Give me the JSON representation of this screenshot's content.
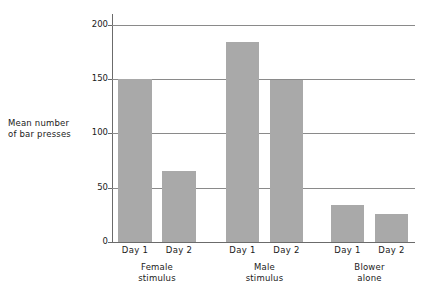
{
  "chart_data": {
    "type": "bar",
    "title": "",
    "xlabel": "",
    "ylabel": "Mean number\nof bar presses",
    "ylim": [
      0,
      210
    ],
    "yticks": [
      0,
      50,
      100,
      150,
      200
    ],
    "ytick_labels": [
      "0",
      "50",
      "100",
      "150",
      "200"
    ],
    "grid": true,
    "legend": "none",
    "groups": [
      {
        "name": "Female\nstimulus",
        "bars": [
          {
            "label": "Day 1",
            "value": 150
          },
          {
            "label": "Day 2",
            "value": 65
          }
        ]
      },
      {
        "name": "Male\nstimulus",
        "bars": [
          {
            "label": "Day 1",
            "value": 184
          },
          {
            "label": "Day 2",
            "value": 149
          }
        ]
      },
      {
        "name": "Blower\nalone",
        "bars": [
          {
            "label": "Day 1",
            "value": 34
          },
          {
            "label": "Day 2",
            "value": 26
          }
        ]
      }
    ],
    "categories": [
      "Female stimulus Day 1",
      "Female stimulus Day 2",
      "Male stimulus Day 1",
      "Male stimulus Day 2",
      "Blower alone Day 1",
      "Blower alone Day 2"
    ],
    "values": [
      150,
      65,
      184,
      149,
      34,
      26
    ],
    "colors": {
      "bar_fill": "#a9a9a9",
      "axis": "#6b6b6b",
      "gridline": "#8a8a8a",
      "text": "#1a1a1a",
      "background": "#ffffff"
    }
  }
}
